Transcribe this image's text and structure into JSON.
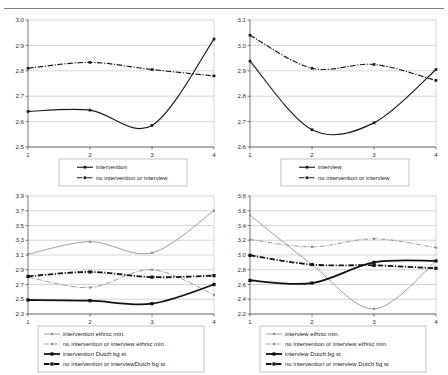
{
  "page": {
    "background_color": "#ffffff",
    "rule_color": "#7d7d7d"
  },
  "colors": {
    "dark": "#1a1a1a",
    "heavy": "#111111",
    "light": "#8a8a8a",
    "grid": "#b8b8b8",
    "axis": "#555555",
    "legend_border": "#9a9a9a"
  },
  "chart_data": [
    {
      "id": "chart-top-left",
      "type": "line",
      "title": "",
      "xlabel": "",
      "ylabel": "",
      "x": [
        1,
        2,
        3,
        4
      ],
      "xticklabels": [
        "1",
        "2",
        "3",
        "4"
      ],
      "ylim": [
        2.5,
        3.0
      ],
      "yticks": [
        2.5,
        2.6,
        2.7,
        2.8,
        2.9,
        3.0
      ],
      "yticklabels": [
        "2.5",
        "2.6",
        "2.7",
        "2.8",
        "2.9",
        "3.0"
      ],
      "grid": true,
      "legend_position": "bottom",
      "series": [
        {
          "name": "intervention",
          "values": [
            2.64,
            2.645,
            2.585,
            2.925
          ],
          "style": "solid",
          "weight": "normal",
          "color": "#1a1a1a",
          "markers": true
        },
        {
          "name": "no intervention or interview",
          "values": [
            2.81,
            2.833,
            2.805,
            2.78
          ],
          "style": "dash-dot",
          "weight": "normal",
          "color": "#1a1a1a",
          "markers": true
        }
      ]
    },
    {
      "id": "chart-top-right",
      "type": "line",
      "title": "",
      "xlabel": "",
      "ylabel": "",
      "x": [
        1,
        2,
        3,
        4
      ],
      "xticklabels": [
        "1",
        "2",
        "3",
        "4"
      ],
      "ylim": [
        2.6,
        3.1
      ],
      "yticks": [
        2.6,
        2.7,
        2.8,
        2.9,
        3.0,
        3.1
      ],
      "yticklabels": [
        "2.6",
        "2.7",
        "2.8",
        "2.9",
        "3.0",
        "3.1"
      ],
      "grid": true,
      "legend_position": "bottom",
      "series": [
        {
          "name": "interview",
          "values": [
            2.938,
            2.668,
            2.695,
            2.905
          ],
          "style": "solid",
          "weight": "normal",
          "color": "#1a1a1a",
          "markers": true
        },
        {
          "name": "no intervention or interview",
          "values": [
            3.04,
            2.91,
            2.925,
            2.862
          ],
          "style": "dash-dot",
          "weight": "normal",
          "color": "#1a1a1a",
          "markers": true
        }
      ]
    },
    {
      "id": "chart-bottom-left",
      "type": "line",
      "title": "",
      "xlabel": "",
      "ylabel": "",
      "x": [
        1,
        2,
        3,
        4
      ],
      "xticklabels": [
        "1",
        "2",
        "3",
        "4"
      ],
      "ylim": [
        2.3,
        3.9
      ],
      "yticks": [
        2.3,
        2.5,
        2.7,
        2.9,
        3.1,
        3.3,
        3.5,
        3.7,
        3.9
      ],
      "yticklabels": [
        "2.3",
        "2.5",
        "2.7",
        "2.9",
        "3.1",
        "3.3",
        "3.5",
        "3.7",
        "3.9"
      ],
      "grid": true,
      "legend_position": "bottom",
      "series": [
        {
          "name": "intervention ethnic min.",
          "values": [
            3.11,
            3.28,
            3.13,
            3.7
          ],
          "style": "solid",
          "weight": "light",
          "color": "#8a8a8a",
          "markers": true
        },
        {
          "name": "no intervention or interview ethnic min.",
          "values": [
            2.8,
            2.66,
            2.9,
            2.56
          ],
          "style": "dash-dot",
          "weight": "light",
          "color": "#8a8a8a",
          "markers": true
        },
        {
          "name": "intervention Dutch  bg st",
          "values": [
            2.49,
            2.48,
            2.44,
            2.7
          ],
          "style": "solid",
          "weight": "heavy",
          "color": "#111111",
          "markers": true
        },
        {
          "name": "no intervention or interviewDutch  bg st",
          "values": [
            2.81,
            2.87,
            2.8,
            2.82
          ],
          "style": "dash-dot",
          "weight": "heavy",
          "color": "#111111",
          "markers": true
        }
      ]
    },
    {
      "id": "chart-bottom-right",
      "type": "line",
      "title": "",
      "xlabel": "",
      "ylabel": "",
      "x": [
        1,
        2,
        3,
        4
      ],
      "xticklabels": [
        "1",
        "2",
        "3",
        "4"
      ],
      "ylim": [
        2.2,
        3.8
      ],
      "yticks": [
        2.2,
        2.4,
        2.6,
        2.8,
        3.0,
        3.2,
        3.4,
        3.6,
        3.8
      ],
      "yticklabels": [
        "2.2",
        "2.4",
        "2.6",
        "2.8",
        "3.0",
        "3.2",
        "3.4",
        "3.6",
        "3.8"
      ],
      "grid": true,
      "legend_position": "bottom",
      "series": [
        {
          "name": "interview ethnic min.",
          "values": [
            3.54,
            2.87,
            2.27,
            2.92
          ],
          "style": "solid",
          "weight": "light",
          "color": "#8a8a8a",
          "markers": true
        },
        {
          "name": "no intervention or interview ethnic min.",
          "values": [
            3.21,
            3.11,
            3.22,
            3.1
          ],
          "style": "dash-dot",
          "weight": "light",
          "color": "#8a8a8a",
          "markers": true
        },
        {
          "name": "interview Dutch  bg st",
          "values": [
            2.655,
            2.62,
            2.9,
            2.92
          ],
          "style": "solid",
          "weight": "heavy",
          "color": "#111111",
          "markers": true
        },
        {
          "name": "no intervention or interview Dutch  bg st",
          "values": [
            2.995,
            2.87,
            2.86,
            2.82
          ],
          "style": "dash-dot",
          "weight": "heavy",
          "color": "#111111",
          "markers": true
        }
      ]
    }
  ]
}
